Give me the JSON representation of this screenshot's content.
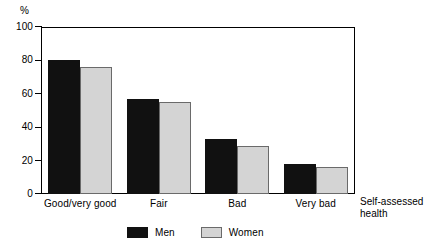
{
  "chart_data": {
    "type": "bar",
    "title": "",
    "subtitle": "",
    "categories": [
      "Good/very good",
      "Fair",
      "Bad",
      "Very bad"
    ],
    "series": [
      {
        "name": "Men",
        "color": "#111111",
        "values": [
          80,
          57,
          33,
          18
        ]
      },
      {
        "name": "Women",
        "color": "#d4d4d4",
        "values": [
          76,
          55,
          29,
          16
        ]
      }
    ],
    "xlabel": "Self-assessed health",
    "ylabel": "%",
    "ylim": [
      0,
      100
    ],
    "yticks": [
      0,
      20,
      40,
      60,
      80,
      100
    ],
    "ytick_labels": [
      "0",
      "20",
      "40",
      "60",
      "80",
      "100"
    ],
    "grid": false,
    "legend_position": "bottom"
  },
  "axes": {
    "unit_label": "%",
    "x_title_line1": "Self-assessed",
    "x_title_line2": "health"
  },
  "legend": {
    "entries": [
      {
        "label": "Men"
      },
      {
        "label": "Women"
      }
    ]
  }
}
